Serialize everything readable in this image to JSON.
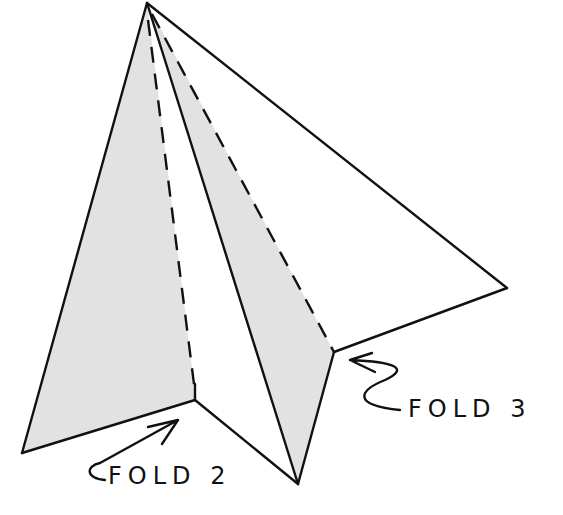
{
  "diagram": {
    "type": "paper-airplane-folding-step",
    "colors": {
      "line": "#111111",
      "shade": "#e2e2e2",
      "background": "#ffffff"
    },
    "labels": [
      {
        "id": "fold2",
        "text": "FOLD 2"
      },
      {
        "id": "fold3",
        "text": "FOLD 3"
      }
    ]
  }
}
